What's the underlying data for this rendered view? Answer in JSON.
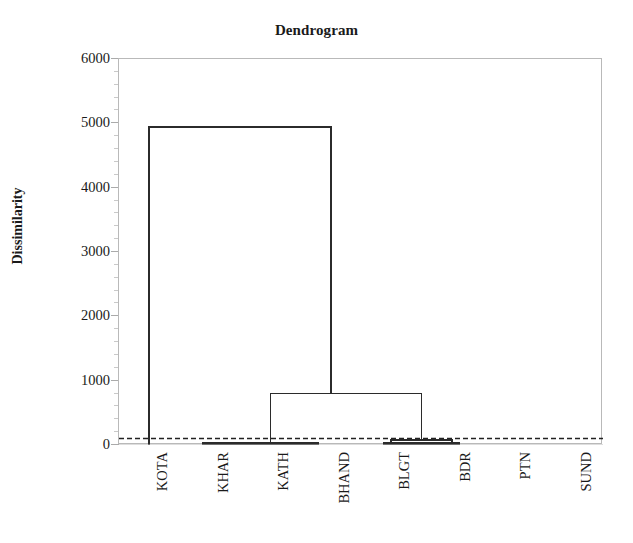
{
  "chart_data": {
    "type": "dendrogram",
    "title": "Dendrogram",
    "xlabel": "",
    "ylabel": "Dissimilarity",
    "ylim": [
      0,
      6000
    ],
    "yticks": [
      0,
      1000,
      2000,
      3000,
      4000,
      5000,
      6000
    ],
    "ytick_labels": [
      "0",
      "1000",
      "2000",
      "3000",
      "4000",
      "5000",
      "6000"
    ],
    "grid": false,
    "legend": "none",
    "leaf_order": [
      "KOTA",
      "KHAR",
      "KATH",
      "BHAND",
      "BLGT",
      "BDR",
      "PTN",
      "SUND"
    ],
    "leaf_labels": [
      "KOTA",
      "KHAR",
      "KATH",
      "BHAND",
      "BLGT",
      "BDR",
      "PTN",
      "SUND"
    ],
    "truncation_line": {
      "value": 100,
      "style": "dashed",
      "color": "#222222"
    },
    "merges": [
      {
        "id": "m1",
        "label": "BLGT + BDR",
        "height": 80,
        "left": "BLGT",
        "right": "BDR"
      },
      {
        "id": "m2",
        "label": "KHAR-KATH cluster + BLGT/BDR cluster",
        "height": 800,
        "left": "cluster-left-mid",
        "right": "m1"
      },
      {
        "id": "m3",
        "label": "KOTA + remaining cluster",
        "height": 4950,
        "left": "KOTA",
        "right": "m2"
      }
    ],
    "link_heights": [
      80,
      800,
      4950
    ]
  },
  "chart": {
    "title": "Dendrogram",
    "y_axis_title": "Dissimilarity"
  },
  "axis": {
    "y_ticks": [
      {
        "value": 6000,
        "label": "6000"
      },
      {
        "value": 5000,
        "label": "5000"
      },
      {
        "value": 4000,
        "label": "4000"
      },
      {
        "value": 3000,
        "label": "3000"
      },
      {
        "value": 2000,
        "label": "2000"
      },
      {
        "value": 1000,
        "label": "1000"
      },
      {
        "value": 0,
        "label": "0"
      }
    ],
    "x_labels": [
      {
        "label": "KOTA"
      },
      {
        "label": "KHAR"
      },
      {
        "label": "KATH"
      },
      {
        "label": "BHAND"
      },
      {
        "label": "BLGT"
      },
      {
        "label": "BDR"
      },
      {
        "label": "PTN"
      },
      {
        "label": "SUND"
      }
    ]
  },
  "colors": {
    "frame": "#b9b9b9",
    "link": "#2b2b2b",
    "dashed": "#222222",
    "text": "#1a1a1a",
    "background": "#ffffff"
  }
}
